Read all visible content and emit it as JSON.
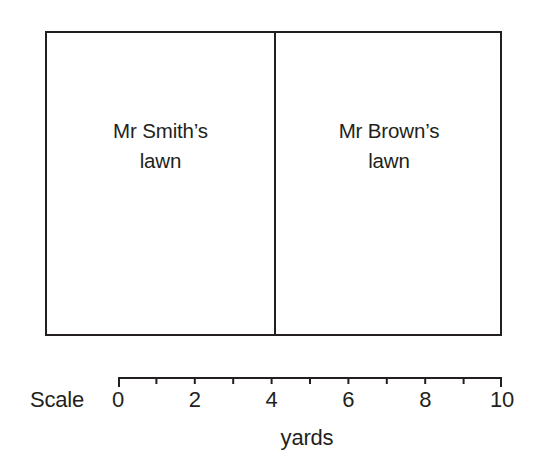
{
  "figure": {
    "title": "",
    "background_color": "#ffffff",
    "stroke_color": "#231f20"
  },
  "diagram": {
    "outline_name": "lawn-boundary-rectangle",
    "divider_name": "lawn-divider-line",
    "regions": [
      {
        "id": "smith",
        "line1": "Mr Smith’s",
        "line2": "lawn",
        "start_yards": 0,
        "end_yards": 4
      },
      {
        "id": "brown",
        "line1": "Mr Brown’s",
        "line2": "lawn",
        "start_yards": 4,
        "end_yards": 10
      }
    ]
  },
  "scale": {
    "label": "Scale",
    "axis_title": "yards",
    "min": 0,
    "max": 10,
    "tick_step": 1,
    "labeled_ticks": [
      {
        "value": 0,
        "label": "0"
      },
      {
        "value": 2,
        "label": "2"
      },
      {
        "value": 4,
        "label": "4"
      },
      {
        "value": 6,
        "label": "6"
      },
      {
        "value": 8,
        "label": "8"
      },
      {
        "value": 10,
        "label": "10"
      }
    ],
    "all_tick_values": [
      0,
      1,
      2,
      3,
      4,
      5,
      6,
      7,
      8,
      9,
      10
    ]
  },
  "chart_data": {
    "type": "bar",
    "title": "",
    "subtitle": "",
    "xlabel": "yards",
    "ylabel": "",
    "orientation": "horizontal",
    "categories": [
      "Mr Smith’s lawn",
      "Mr Brown’s lawn"
    ],
    "values": [
      4,
      6
    ],
    "units": "yards",
    "xlim": [
      0,
      10
    ],
    "axis_ticks": [
      0,
      1,
      2,
      3,
      4,
      5,
      6,
      7,
      8,
      9,
      10
    ],
    "labeled_ticks": [
      0,
      2,
      4,
      6,
      8,
      10
    ],
    "grid": false,
    "legend": "none",
    "annotations": [
      "Scale bar runs 0 to 10 yards beneath the diagram",
      "Divider between the two lawns sits at the 4 yard mark"
    ]
  }
}
